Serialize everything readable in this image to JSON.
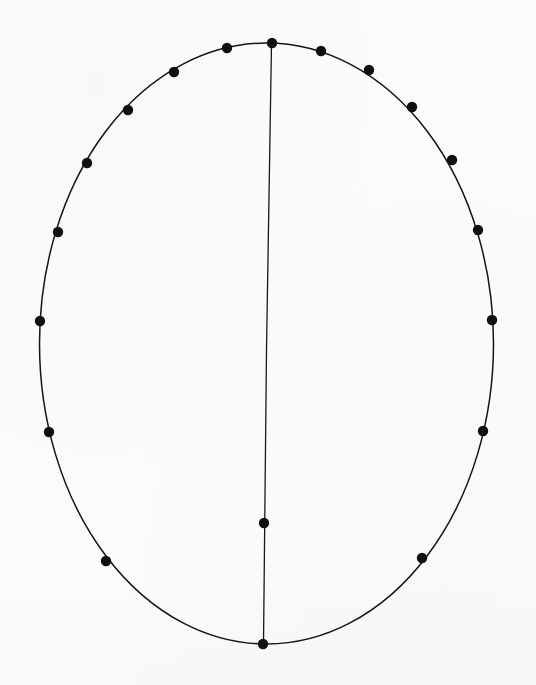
{
  "page": {
    "width": 536,
    "height": 685,
    "background_color": "#fbfbfa",
    "ink_color": "#111111"
  },
  "figure": {
    "name": "ellipse-point-diagram",
    "description": "A tall ellipse drawn in thin black ink with 19 filled round marker dots placed along its outline and one marker on an interior vertical chord.",
    "stroke_color": "#141414",
    "outline_stroke_width": 1.5,
    "chord_stroke_width": 1.3,
    "marker_color": "#101010",
    "marker_radius": 5.2
  },
  "chart_data": {
    "type": "scatter",
    "title": "",
    "xlabel": "",
    "ylabel": "",
    "grid": false,
    "legend": null,
    "xlim": [
      0,
      536
    ],
    "ylim": [
      685,
      0
    ],
    "shapes": [
      {
        "name": "ellipse-outline",
        "kind": "ellipse",
        "cx": 266.5,
        "cy": 343.5,
        "rx": 227.0,
        "ry": 300.5,
        "filled": false
      },
      {
        "name": "vertical-chord",
        "kind": "polyline",
        "points": [
          [
            271.5,
            43.5
          ],
          [
            266.5,
            350.0
          ],
          [
            263.5,
            644.0
          ]
        ],
        "filled": false
      }
    ],
    "series": [
      {
        "name": "boundary-markers",
        "marker": "filled-circle",
        "points": [
          [
            272,
            43
          ],
          [
            321,
            51
          ],
          [
            369,
            70
          ],
          [
            412,
            107
          ],
          [
            452,
            160
          ],
          [
            478,
            230
          ],
          [
            492,
            320
          ],
          [
            483,
            431
          ],
          [
            422,
            558
          ],
          [
            263,
            644
          ],
          [
            106,
            561
          ],
          [
            49,
            432
          ],
          [
            40,
            321
          ],
          [
            58,
            232
          ],
          [
            87,
            163
          ],
          [
            128,
            110
          ],
          [
            174,
            72
          ],
          [
            227,
            48
          ]
        ]
      },
      {
        "name": "chord-marker",
        "marker": "filled-circle",
        "points": [
          [
            264,
            523
          ]
        ]
      }
    ],
    "counts": {
      "boundary_marker_count": 18,
      "chord_marker_count": 1,
      "total_marker_count": 19
    }
  }
}
